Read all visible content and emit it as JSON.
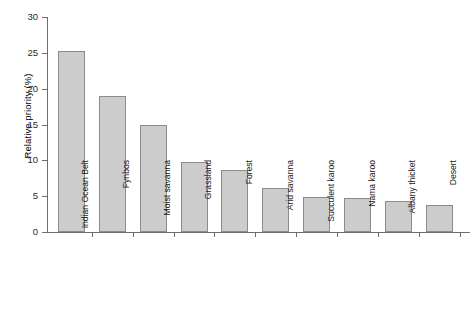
{
  "chart_data": {
    "type": "bar",
    "title": "",
    "subtitle": "",
    "xlabel": "",
    "ylabel": "Relative priority (%)",
    "categories": [
      "Indian Ocean Belt",
      "Fynbos",
      "Moist savanna",
      "Grassland",
      "Forest",
      "Arid savanna",
      "Succulent karoo",
      "Nama karoo",
      "Albany thicket",
      "Desert"
    ],
    "values": [
      25.2,
      19.0,
      15.0,
      9.7,
      8.7,
      6.2,
      4.9,
      4.8,
      4.3,
      3.7
    ],
    "ylim": [
      0,
      30
    ],
    "ytick_labels": [
      "0",
      "5",
      "10",
      "15",
      "20",
      "25",
      "30"
    ],
    "ytick_values": [
      0,
      5,
      10,
      15,
      20,
      25,
      30
    ],
    "grid": false,
    "legend": null,
    "legend_position": "none",
    "bar_fill_color": "#cccccc",
    "bar_border_color": "#8c8c8c",
    "axis_color": "#6e6e6e",
    "background_color": "#ffffff",
    "text_color": "#1a1a1a",
    "xtick_rotation_degrees": -90
  }
}
